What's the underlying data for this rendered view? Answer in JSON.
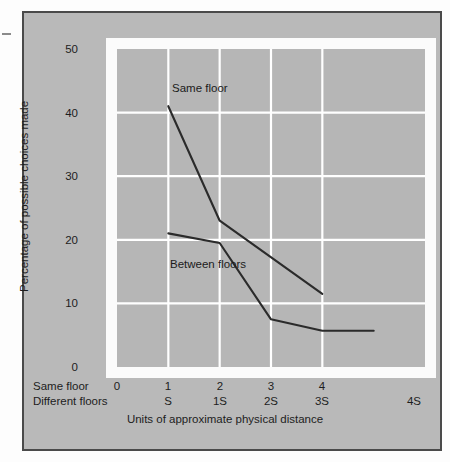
{
  "figure": {
    "background_color": "#b9b9b9",
    "plot_background_color": "#b6b6b6",
    "frame_color": "#fbfbfb",
    "gridline_color": "#ffffff",
    "line_color": "#2b2b2b",
    "border_color": "#4a4a4a"
  },
  "chart_data": {
    "type": "line",
    "title": "",
    "xlabel": "Units of approximate physical distance",
    "ylabel": "Percentage of possible choices made",
    "ylim": [
      0,
      50
    ],
    "yticks": [
      0,
      10,
      20,
      30,
      40,
      50
    ],
    "grid": true,
    "legend_position": "inline-annotations",
    "x_axis_rows": [
      {
        "name": "Same floor",
        "ticks": [
          "0",
          "1",
          "2",
          "3",
          "4",
          ""
        ]
      },
      {
        "name": "Different floors",
        "ticks": [
          "",
          "S",
          "1S",
          "2S",
          "3S",
          "4S"
        ]
      }
    ],
    "x_positions": [
      0,
      1,
      2,
      3,
      4,
      5
    ],
    "series": [
      {
        "name": "Same floor",
        "x": [
          1,
          2,
          4
        ],
        "values": [
          41,
          23,
          11.5
        ]
      },
      {
        "name": "Between floors",
        "x": [
          1,
          2,
          3,
          4,
          5
        ],
        "values": [
          21,
          19.5,
          7.5,
          5.7,
          5.7
        ]
      }
    ],
    "annotations": [
      {
        "text": "Same floor",
        "x": 1.35,
        "y": 44
      },
      {
        "text": "Between floors",
        "x": 1.3,
        "y": 14.5
      }
    ]
  }
}
